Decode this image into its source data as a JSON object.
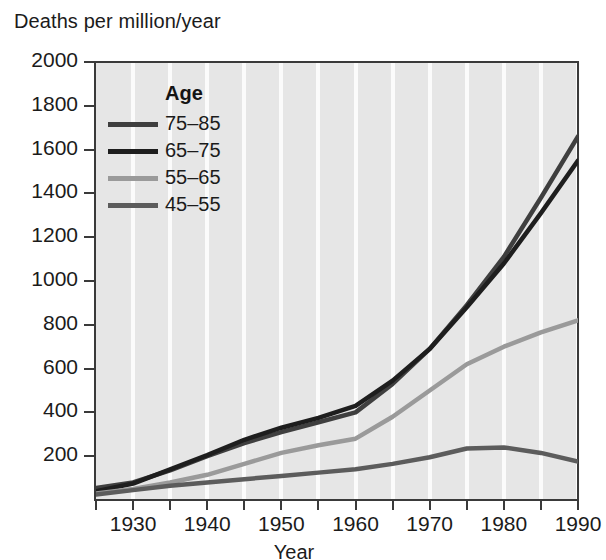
{
  "figure": {
    "y_axis_caption": "Deaths per million/year",
    "x_axis_title": "Year",
    "plot_background": "#e6e6e6",
    "gridline_color": "#fbfbfb",
    "axis_color": "#3a3a3a"
  },
  "legend": {
    "title": "Age",
    "entries": [
      {
        "label": "75–85",
        "color": "#3f3f3f"
      },
      {
        "label": "65–75",
        "color": "#1e1e1e"
      },
      {
        "label": "55–65",
        "color": "#9a9a9a"
      },
      {
        "label": "45–55",
        "color": "#5c5c5c"
      }
    ]
  },
  "chart_data": {
    "type": "line",
    "title": "",
    "xlabel": "Year",
    "ylabel": "Deaths per million/year",
    "xlim": [
      1925,
      1990
    ],
    "ylim": [
      0,
      2000
    ],
    "yticks": [
      200,
      400,
      600,
      800,
      1000,
      1200,
      1400,
      1600,
      1800,
      2000
    ],
    "xticks": [
      1925,
      1930,
      1935,
      1940,
      1945,
      1950,
      1955,
      1960,
      1965,
      1970,
      1975,
      1980,
      1985,
      1990
    ],
    "xtick_labels": [
      "",
      "1930",
      "",
      "1940",
      "",
      "1950",
      "",
      "1960",
      "",
      "1970",
      "",
      "1980",
      "",
      "1990"
    ],
    "grid": "vertical",
    "legend_position": "upper-left-inside",
    "x": [
      1925,
      1930,
      1935,
      1940,
      1945,
      1950,
      1955,
      1960,
      1965,
      1970,
      1975,
      1980,
      1985,
      1990
    ],
    "series": [
      {
        "name": "75–85",
        "color": "#3f3f3f",
        "values": [
          55,
          80,
          135,
          200,
          260,
          310,
          355,
          400,
          530,
          690,
          890,
          1110,
          1380,
          1660
        ]
      },
      {
        "name": "65–75",
        "color": "#1e1e1e",
        "values": [
          40,
          75,
          140,
          205,
          275,
          330,
          375,
          430,
          545,
          690,
          880,
          1080,
          1310,
          1550
        ]
      },
      {
        "name": "55–65",
        "color": "#9a9a9a",
        "values": [
          30,
          50,
          80,
          115,
          165,
          215,
          250,
          280,
          380,
          500,
          620,
          700,
          765,
          820
        ]
      },
      {
        "name": "45–55",
        "color": "#5c5c5c",
        "values": [
          25,
          45,
          65,
          80,
          95,
          110,
          125,
          140,
          165,
          195,
          235,
          240,
          215,
          175
        ]
      }
    ]
  }
}
